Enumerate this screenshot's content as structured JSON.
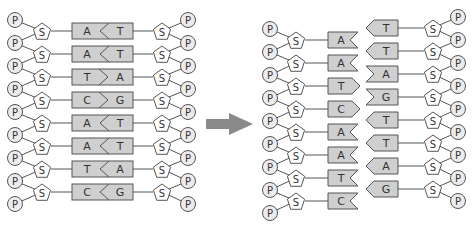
{
  "diagram": {
    "title": "",
    "labels": {
      "phosphate": "P",
      "sugar": "S"
    },
    "colors": {
      "base_fill": "#cfcfcf",
      "stroke": "#555555",
      "phosphate_fill": "#ececec",
      "arrow": "#8a8a8a"
    },
    "left_duplex": {
      "pairs": [
        {
          "left": "A",
          "right": "T",
          "notch": "<"
        },
        {
          "left": "A",
          "right": "T",
          "notch": "<"
        },
        {
          "left": "T",
          "right": "A",
          "notch": ">"
        },
        {
          "left": "C",
          "right": "G",
          "notch": ">"
        },
        {
          "left": "A",
          "right": "T",
          "notch": "<"
        },
        {
          "left": "A",
          "right": "T",
          "notch": "<"
        },
        {
          "left": "T",
          "right": "A",
          "notch": "<"
        },
        {
          "left": "C",
          "right": "G",
          "notch": "<"
        }
      ]
    },
    "arrow": {
      "direction": "right",
      "meaning": "strand separation"
    },
    "right_separated": {
      "strand_left": [
        {
          "base": "A",
          "end": "notch"
        },
        {
          "base": "A",
          "end": "notch"
        },
        {
          "base": "T",
          "end": "point"
        },
        {
          "base": "C",
          "end": "point"
        },
        {
          "base": "A",
          "end": "notch"
        },
        {
          "base": "A",
          "end": "notch"
        },
        {
          "base": "T",
          "end": "notch"
        },
        {
          "base": "C",
          "end": "notch"
        }
      ],
      "strand_right": [
        {
          "base": "T",
          "end": "point"
        },
        {
          "base": "T",
          "end": "point"
        },
        {
          "base": "A",
          "end": "notch"
        },
        {
          "base": "G",
          "end": "notch"
        },
        {
          "base": "T",
          "end": "point"
        },
        {
          "base": "T",
          "end": "point"
        },
        {
          "base": "A",
          "end": "point"
        },
        {
          "base": "G",
          "end": "point"
        }
      ]
    }
  }
}
